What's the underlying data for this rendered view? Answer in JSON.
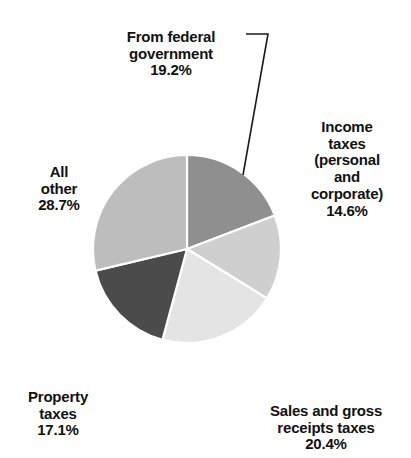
{
  "chart_data": {
    "type": "pie",
    "title": "",
    "subtitle": "",
    "xlabel": "",
    "ylabel": "",
    "legend_position": "none",
    "grid": false,
    "units": "percent",
    "start_angle_deg": 0,
    "direction": "clockwise",
    "center": {
      "x": 187,
      "y": 249
    },
    "radius": 94,
    "categories": [
      "From federal government",
      "Income taxes (personal and corporate)",
      "Sales and gross receipts taxes",
      "Property taxes",
      "All other"
    ],
    "values": [
      19.2,
      14.6,
      20.4,
      17.1,
      28.7
    ],
    "value_labels": [
      "19.2%",
      "14.6%",
      "20.4%",
      "17.1%",
      "28.7%"
    ],
    "slice_colors": [
      "#8f8f8f",
      "#cfcfcf",
      "#e4e4e4",
      "#4b4b4b",
      "#bdbdbd"
    ],
    "slice_edge_color": "#ffffff",
    "slices": [
      {
        "name": "From federal government",
        "label_lines": [
          "From federal",
          "government"
        ],
        "value": 19.2,
        "value_label": "19.2%",
        "color": "#8f8f8f",
        "has_leader_line": true
      },
      {
        "name": "Income taxes (personal and corporate)",
        "label_lines": [
          "Income",
          "taxes",
          "(personal",
          "and",
          "corporate)"
        ],
        "value": 14.6,
        "value_label": "14.6%",
        "color": "#cfcfcf",
        "has_leader_line": false
      },
      {
        "name": "Sales and gross receipts taxes",
        "label_lines": [
          "Sales and gross",
          "receipts taxes"
        ],
        "value": 20.4,
        "value_label": "20.4%",
        "color": "#e4e4e4",
        "has_leader_line": false
      },
      {
        "name": "Property taxes",
        "label_lines": [
          "Property",
          "taxes"
        ],
        "value": 17.1,
        "value_label": "17.1%",
        "color": "#4b4b4b",
        "has_leader_line": false
      },
      {
        "name": "All other",
        "label_lines": [
          "All",
          "other"
        ],
        "value": 28.7,
        "value_label": "28.7%",
        "color": "#bdbdbd",
        "has_leader_line": false
      }
    ]
  },
  "labels": {
    "federal": {
      "text": "From federal\ngovernment",
      "pct": "19.2%"
    },
    "income": {
      "text": "Income\ntaxes\n(personal\nand\ncorporate)",
      "pct": "14.6%"
    },
    "sales": {
      "text": "Sales and gross\nreceipts taxes",
      "pct": "20.4%"
    },
    "property": {
      "text": "Property\ntaxes",
      "pct": "17.1%"
    },
    "allother": {
      "text": "All\nother",
      "pct": "28.7%"
    }
  },
  "colors": {
    "background": "#ffffff",
    "text": "#111111",
    "leader_line": "#1a1a1a"
  }
}
